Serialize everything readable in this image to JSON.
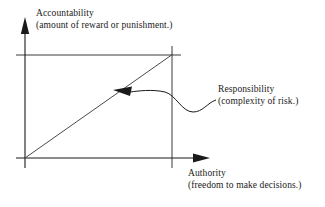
{
  "diagram": {
    "title_axis_y": {
      "name": "Accountability",
      "line1": "Accountability",
      "line2": "(amount of reward or punishment.)"
    },
    "title_axis_x": {
      "name": "Authority",
      "line1": "Authority",
      "line2": "(freedom to make decisions.)"
    },
    "annotation": {
      "name": "Responsibility",
      "line1": "Responsibility",
      "line2": "(complexity of risk.)"
    },
    "colors": {
      "stroke": "#1a1a1a",
      "background": "#ffffff",
      "text": "#1a1a1a"
    },
    "geometry": {
      "origin_x": 25,
      "origin_y": 158,
      "y_axis_tip_y": 18,
      "x_axis_tip_x": 210,
      "corner_x": 172,
      "corner_y": 55,
      "guide_h_left_x": 16,
      "guide_h_right_x": 181,
      "guide_v_bottom_y": 168,
      "arrow_target_x": 114,
      "arrow_target_y": 90
    }
  }
}
